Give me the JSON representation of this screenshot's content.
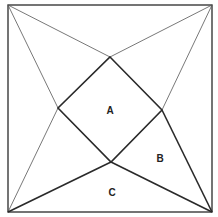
{
  "diagram": {
    "type": "geometry",
    "square": {
      "tl": [
        8,
        5
      ],
      "tr": [
        212,
        5
      ],
      "br": [
        212,
        212
      ],
      "bl": [
        8,
        212
      ]
    },
    "inner_quad": {
      "top": [
        110,
        57
      ],
      "right": [
        162,
        110
      ],
      "bottom": [
        111,
        162
      ],
      "left": [
        58,
        108
      ]
    },
    "labels": [
      {
        "id": "A",
        "text": "A",
        "x": 110,
        "y": 114
      },
      {
        "id": "B",
        "text": "B",
        "x": 160,
        "y": 162
      },
      {
        "id": "C",
        "text": "C",
        "x": 112,
        "y": 196
      }
    ]
  }
}
